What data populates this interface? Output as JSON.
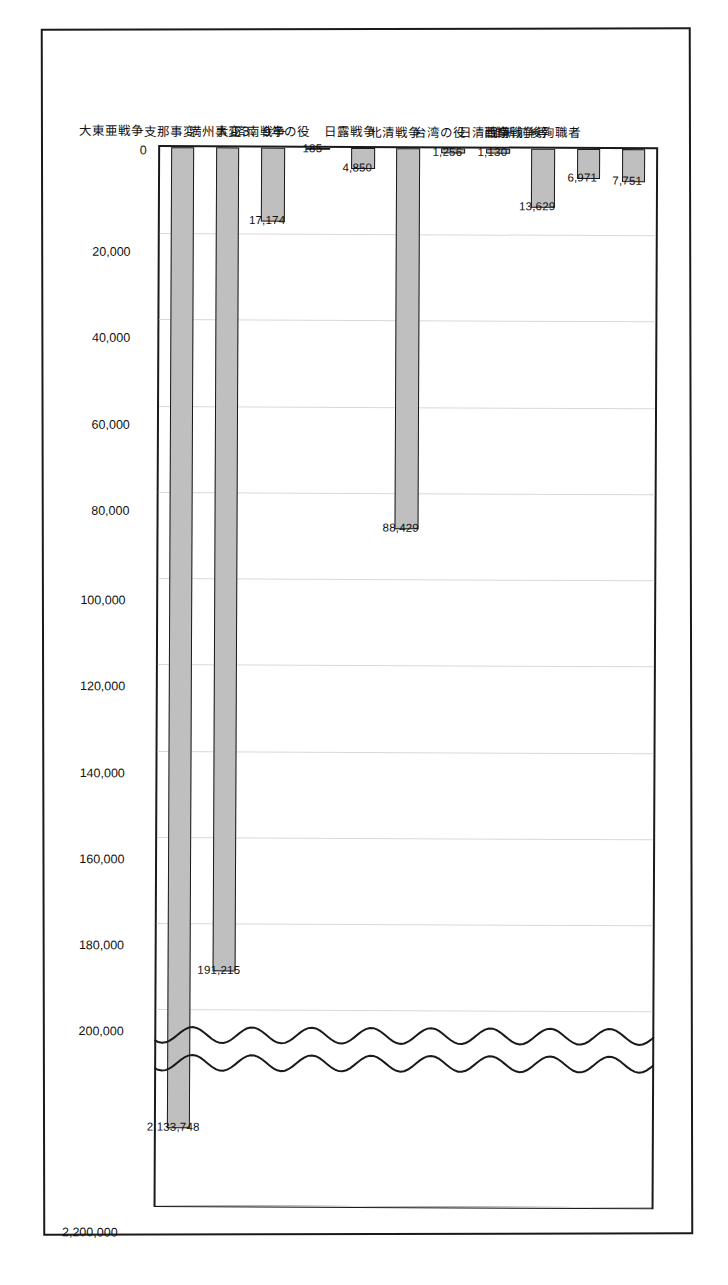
{
  "chart_data": {
    "type": "bar",
    "orientation": "horizontal",
    "title": "",
    "xlabel": "",
    "ylabel": "",
    "grid": true,
    "legend": "none",
    "axis_break": {
      "present": true,
      "style": "double-wavy-line",
      "break_after": 200000,
      "resume_at": 2100000
    },
    "xlim": [
      0,
      2200000
    ],
    "tick_labels": [
      "0",
      "20,000",
      "40,000",
      "60,000",
      "80,000",
      "100,000",
      "120,000",
      "140,000",
      "160,000",
      "180,000",
      "200,000",
      "2,200,000"
    ],
    "tick_values": [
      0,
      20000,
      40000,
      60000,
      80000,
      100000,
      120000,
      140000,
      160000,
      180000,
      200000,
      2200000
    ],
    "categories": [
      "維新前後殉職者",
      "西南戦争等",
      "日清戦争",
      "台湾の役",
      "北清戦争",
      "日露戦争",
      "大正3、9年の役",
      "済南戦争",
      "満州事変",
      "支那事変",
      "大東亜戦争"
    ],
    "values": [
      7751,
      6971,
      13629,
      1130,
      1256,
      88429,
      4850,
      185,
      17174,
      191215,
      2133748
    ],
    "value_labels": [
      "7,751",
      "6,971",
      "13,629",
      "1,130",
      "1,256",
      "88,429",
      "4,850",
      "185",
      "17,174",
      "191,215",
      "2,133,748"
    ],
    "colors": {
      "bar_fill": "#bfbfbf",
      "bar_border": "#1a1a1a",
      "gridline": "#d9d9d9",
      "frame": "#1a1a1a",
      "text": "#111111",
      "background": "#ffffff"
    }
  }
}
